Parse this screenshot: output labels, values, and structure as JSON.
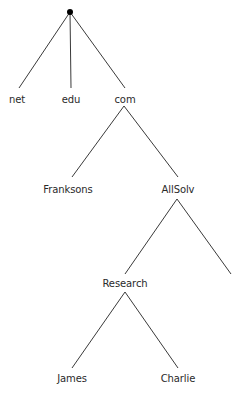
{
  "diagram": {
    "type": "tree",
    "colors": {
      "edge": "#3a3a3a",
      "text": "#2a2a2a",
      "root": "#000000",
      "background": "#ffffff"
    },
    "root": {
      "id": "root",
      "label": "",
      "x": 70,
      "y": 12
    },
    "nodes": [
      {
        "id": "net",
        "label": "net",
        "x": 17,
        "y": 94
      },
      {
        "id": "edu",
        "label": "edu",
        "x": 71,
        "y": 94
      },
      {
        "id": "com",
        "label": "com",
        "x": 125,
        "y": 94
      },
      {
        "id": "franksons",
        "label": "Franksons",
        "x": 68,
        "y": 184
      },
      {
        "id": "allsolv",
        "label": "AllSolv",
        "x": 178,
        "y": 184
      },
      {
        "id": "research",
        "label": "Research",
        "x": 125,
        "y": 278
      },
      {
        "id": "james",
        "label": "James",
        "x": 72,
        "y": 373
      },
      {
        "id": "charlie",
        "label": "Charlie",
        "x": 178,
        "y": 373
      }
    ],
    "edges": [
      {
        "from": "root",
        "to": "net",
        "x1": 70,
        "y1": 12,
        "x2": 19,
        "y2": 88
      },
      {
        "from": "root",
        "to": "edu",
        "x1": 70,
        "y1": 12,
        "x2": 71,
        "y2": 88
      },
      {
        "from": "root",
        "to": "com",
        "x1": 70,
        "y1": 12,
        "x2": 125,
        "y2": 88
      },
      {
        "from": "com",
        "to": "franksons",
        "x1": 124,
        "y1": 106,
        "x2": 72,
        "y2": 177
      },
      {
        "from": "com",
        "to": "allsolv",
        "x1": 124,
        "y1": 106,
        "x2": 178,
        "y2": 177
      },
      {
        "from": "allsolv",
        "to": "research",
        "x1": 177,
        "y1": 199,
        "x2": 125,
        "y2": 274
      },
      {
        "from": "allsolv",
        "to": "unlabeled",
        "x1": 177,
        "y1": 199,
        "x2": 231,
        "y2": 274
      },
      {
        "from": "research",
        "to": "james",
        "x1": 125,
        "y1": 292,
        "x2": 72,
        "y2": 368
      },
      {
        "from": "research",
        "to": "charlie",
        "x1": 125,
        "y1": 292,
        "x2": 178,
        "y2": 368
      }
    ]
  }
}
